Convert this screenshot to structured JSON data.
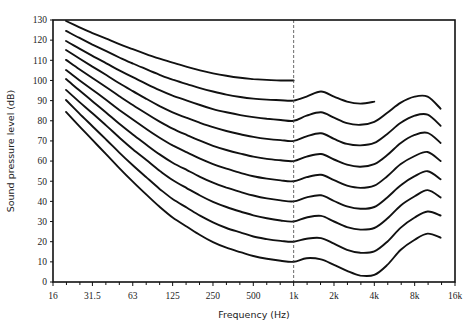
{
  "chart_data": {
    "type": "line",
    "title": "",
    "xlabel": "Frequency (Hz)",
    "ylabel": "Sound pressure level (dB)",
    "xscale": "log2",
    "xlim": [
      16,
      16000
    ],
    "ylim": [
      0,
      130
    ],
    "x_ticks": [
      {
        "value": 16,
        "label": "16"
      },
      {
        "value": 31.5,
        "label": "31.5"
      },
      {
        "value": 63,
        "label": "63"
      },
      {
        "value": 125,
        "label": "125"
      },
      {
        "value": 250,
        "label": "250"
      },
      {
        "value": 500,
        "label": "500"
      },
      {
        "value": 1000,
        "label": "1k"
      },
      {
        "value": 2000,
        "label": "2k"
      },
      {
        "value": 4000,
        "label": "4k"
      },
      {
        "value": 8000,
        "label": "8k"
      },
      {
        "value": 16000,
        "label": "16k"
      }
    ],
    "y_ticks": [
      0,
      10,
      20,
      30,
      40,
      50,
      60,
      70,
      80,
      90,
      100,
      110,
      120,
      130
    ],
    "grid": false,
    "legend": "none",
    "reference_line": {
      "x": 1000,
      "style": "dashed"
    },
    "series": [
      {
        "name": "100 phon",
        "x": [
          20,
          25,
          31.5,
          40,
          50,
          63,
          80,
          100,
          125,
          160,
          200,
          250,
          315,
          400,
          500,
          630,
          800,
          1000
        ],
        "values": [
          129.5,
          126.5,
          123.5,
          120.7,
          118.0,
          115.5,
          113.0,
          110.8,
          108.8,
          106.8,
          105.0,
          103.5,
          102.3,
          101.3,
          100.7,
          100.3,
          100.0,
          100.0
        ]
      },
      {
        "name": "90 phon",
        "x": [
          20,
          25,
          31.5,
          40,
          50,
          63,
          80,
          100,
          125,
          160,
          200,
          250,
          315,
          400,
          500,
          630,
          800,
          1000,
          1250,
          1600,
          2000,
          2500,
          3150,
          4000
        ],
        "values": [
          124.6,
          121.2,
          117.8,
          114.5,
          111.4,
          108.4,
          105.5,
          102.8,
          100.4,
          98.2,
          96.2,
          94.5,
          93.0,
          91.8,
          91.0,
          90.5,
          90.2,
          90.0,
          92.0,
          94.5,
          92.0,
          89.5,
          88.5,
          89.5
        ]
      },
      {
        "name": "80 phon",
        "x": [
          20,
          25,
          31.5,
          40,
          50,
          63,
          80,
          100,
          125,
          160,
          200,
          250,
          315,
          400,
          500,
          630,
          800,
          1000,
          1250,
          1600,
          2000,
          2500,
          3150,
          4000,
          5000,
          6300,
          8000,
          10000,
          12500
        ],
        "values": [
          119.6,
          115.9,
          112.2,
          108.5,
          105.0,
          101.6,
          98.2,
          95.2,
          92.5,
          90.0,
          87.8,
          85.8,
          84.2,
          82.8,
          81.8,
          81.0,
          80.4,
          80.0,
          82.5,
          84.2,
          81.5,
          78.8,
          78.0,
          79.5,
          84.0,
          89.0,
          92.0,
          92.0,
          86.0
        ]
      },
      {
        "name": "70 phon",
        "x": [
          20,
          25,
          31.5,
          40,
          50,
          63,
          80,
          100,
          125,
          160,
          200,
          250,
          315,
          400,
          500,
          630,
          800,
          1000,
          1250,
          1600,
          2000,
          2500,
          3150,
          4000,
          5000,
          6300,
          8000,
          10000,
          12500
        ],
        "values": [
          115.1,
          111.0,
          106.9,
          102.7,
          98.6,
          94.7,
          90.8,
          87.3,
          84.2,
          81.4,
          79.0,
          76.8,
          74.9,
          73.3,
          72.0,
          71.0,
          70.4,
          70.0,
          72.3,
          73.8,
          71.0,
          68.5,
          67.8,
          69.0,
          73.5,
          79.0,
          82.5,
          83.0,
          77.5
        ]
      },
      {
        "name": "60 phon",
        "x": [
          20,
          25,
          31.5,
          40,
          50,
          63,
          80,
          100,
          125,
          160,
          200,
          250,
          315,
          400,
          500,
          630,
          800,
          1000,
          1250,
          1600,
          2000,
          2500,
          3150,
          4000,
          5000,
          6300,
          8000,
          10000,
          12500
        ],
        "values": [
          110.2,
          105.7,
          101.2,
          96.6,
          92.2,
          87.8,
          83.5,
          79.6,
          76.1,
          72.9,
          70.1,
          67.6,
          65.5,
          63.7,
          62.2,
          61.1,
          60.4,
          60.0,
          62.2,
          63.5,
          60.8,
          58.2,
          57.2,
          58.5,
          63.0,
          69.0,
          73.0,
          74.0,
          69.0
        ]
      },
      {
        "name": "50 phon",
        "x": [
          20,
          25,
          31.5,
          40,
          50,
          63,
          80,
          100,
          125,
          160,
          200,
          250,
          315,
          400,
          500,
          630,
          800,
          1000,
          1250,
          1600,
          2000,
          2500,
          3150,
          4000,
          5000,
          6300,
          8000,
          10000,
          12500
        ],
        "values": [
          105.2,
          100.3,
          95.4,
          90.3,
          85.4,
          80.6,
          75.8,
          71.6,
          67.8,
          64.3,
          61.2,
          58.5,
          56.2,
          54.2,
          52.5,
          51.3,
          50.4,
          50.0,
          52.0,
          53.2,
          50.5,
          47.8,
          46.7,
          47.8,
          52.5,
          58.5,
          62.5,
          64.5,
          60.0
        ]
      },
      {
        "name": "40 phon",
        "x": [
          20,
          25,
          31.5,
          40,
          50,
          63,
          80,
          100,
          125,
          160,
          200,
          250,
          315,
          400,
          500,
          630,
          800,
          1000,
          1250,
          1600,
          2000,
          2500,
          3150,
          4000,
          5000,
          6300,
          8000,
          10000,
          12500
        ],
        "values": [
          100.7,
          95.2,
          89.7,
          84.0,
          78.5,
          73.2,
          68.0,
          63.3,
          59.2,
          55.5,
          52.2,
          49.3,
          46.8,
          44.7,
          42.9,
          41.5,
          40.5,
          40.0,
          42.0,
          43.0,
          40.2,
          37.5,
          36.3,
          37.2,
          42.0,
          48.0,
          52.5,
          55.0,
          51.0
        ]
      },
      {
        "name": "30 phon",
        "x": [
          20,
          25,
          31.5,
          40,
          50,
          63,
          80,
          100,
          125,
          160,
          200,
          250,
          315,
          400,
          500,
          630,
          800,
          1000,
          1250,
          1600,
          2000,
          2500,
          3150,
          4000,
          5000,
          6300,
          8000,
          10000,
          12500
        ],
        "values": [
          95.3,
          89.5,
          83.7,
          77.6,
          71.7,
          65.9,
          60.4,
          55.2,
          50.6,
          46.5,
          42.9,
          39.8,
          37.2,
          35.0,
          33.1,
          31.6,
          30.5,
          30.0,
          32.0,
          32.8,
          30.0,
          27.2,
          26.0,
          26.8,
          31.5,
          38.0,
          42.5,
          45.6,
          42.0
        ]
      },
      {
        "name": "20 phon",
        "x": [
          20,
          25,
          31.5,
          40,
          50,
          63,
          80,
          100,
          125,
          160,
          200,
          250,
          315,
          400,
          500,
          630,
          800,
          1000,
          1250,
          1600,
          2000,
          2500,
          3150,
          4000,
          5000,
          6300,
          8000,
          10000,
          12500
        ],
        "values": [
          90.3,
          83.8,
          77.3,
          70.6,
          64.2,
          57.9,
          51.8,
          46.2,
          41.2,
          36.8,
          32.9,
          29.6,
          26.8,
          24.6,
          22.6,
          21.3,
          20.4,
          20.0,
          21.5,
          21.8,
          19.0,
          16.0,
          14.5,
          15.2,
          20.0,
          27.0,
          32.0,
          35.0,
          33.0
        ]
      },
      {
        "name": "10 phon",
        "x": [
          20,
          25,
          31.5,
          40,
          50,
          63,
          80,
          100,
          125,
          160,
          200,
          250,
          315,
          400,
          500,
          630,
          800,
          1000,
          1250,
          1600,
          2000,
          2500,
          3150,
          4000,
          5000,
          6300,
          8000,
          10000,
          12500
        ],
        "values": [
          84.4,
          77.5,
          70.5,
          63.3,
          56.5,
          49.8,
          43.2,
          37.3,
          32.0,
          27.4,
          23.3,
          19.8,
          17.0,
          14.8,
          12.9,
          11.5,
          10.5,
          10.0,
          11.8,
          11.2,
          8.5,
          5.5,
          3.2,
          3.5,
          8.5,
          16.0,
          21.0,
          24.0,
          22.0
        ]
      }
    ]
  }
}
